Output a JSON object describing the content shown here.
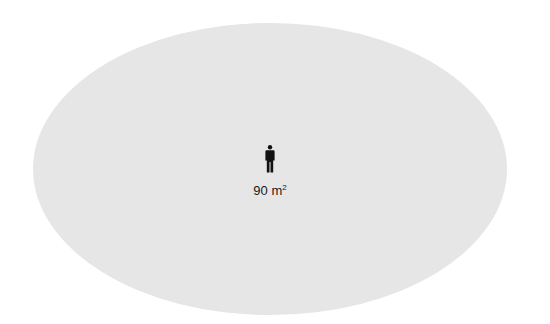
{
  "diagram": {
    "shape": "ellipse",
    "fill_color": "#e6e6e6",
    "icon": "person-icon",
    "area_value": "90",
    "area_unit": "m",
    "area_unit_exponent": "2"
  }
}
